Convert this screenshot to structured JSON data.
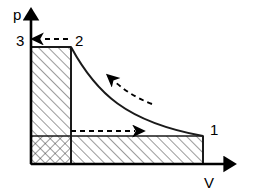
{
  "figure": {
    "type": "pv-diagram",
    "background_color": "#ffffff",
    "line_color": "#1a1a1a"
  },
  "axes": {
    "vertical": {
      "label": "p",
      "name": "pressure-axis",
      "arrow": "up"
    },
    "horizontal": {
      "label": "V",
      "name": "volume-axis",
      "arrow": "right"
    },
    "origin": {
      "x": 31,
      "y": 164
    }
  },
  "states": [
    {
      "id": "1",
      "label": "1",
      "x": 203,
      "y": 136,
      "label_x": 211,
      "label_y": 133
    },
    {
      "id": "2",
      "label": "2",
      "x": 71,
      "y": 47,
      "label_x": 76,
      "label_y": 44
    },
    {
      "id": "3",
      "label": "3",
      "x": 31,
      "y": 47,
      "label_x": 18,
      "label_y": 44
    }
  ],
  "processes": [
    {
      "name": "expansion-curve-1-to-2",
      "style": "solid",
      "from": "2",
      "to": "1",
      "shape": "hyperbola"
    },
    {
      "name": "isobaric-2-to-3",
      "style": "solid",
      "from": "2",
      "to": "3"
    },
    {
      "name": "isochoric-3-to-base",
      "style": "solid",
      "from": "3",
      "to": "origin"
    }
  ],
  "direction_arrows": [
    {
      "name": "arrow-2-to-3",
      "style": "dashed",
      "direction": "left",
      "x1": 68,
      "y1": 39,
      "x2": 36,
      "y2": 39
    },
    {
      "name": "arrow-1-to-2-along-curve",
      "style": "dashed",
      "direction": "up-left"
    },
    {
      "name": "arrow-left-to-right-lower",
      "style": "dashed",
      "direction": "right",
      "x1": 71,
      "y1": 131,
      "x2": 144,
      "y2": 131
    }
  ],
  "regions": [
    {
      "name": "work-area-left-column",
      "hatch": "diagonal-forward",
      "x": 31,
      "y": 47,
      "width": 40,
      "height": 89
    },
    {
      "name": "work-area-lower-band",
      "hatch": "diagonal-forward",
      "x": 71,
      "y": 136,
      "width": 132,
      "height": 28
    },
    {
      "name": "work-area-cross-hatched",
      "hatch": "cross-hatch",
      "x": 31,
      "y": 136,
      "width": 40,
      "height": 28
    }
  ]
}
